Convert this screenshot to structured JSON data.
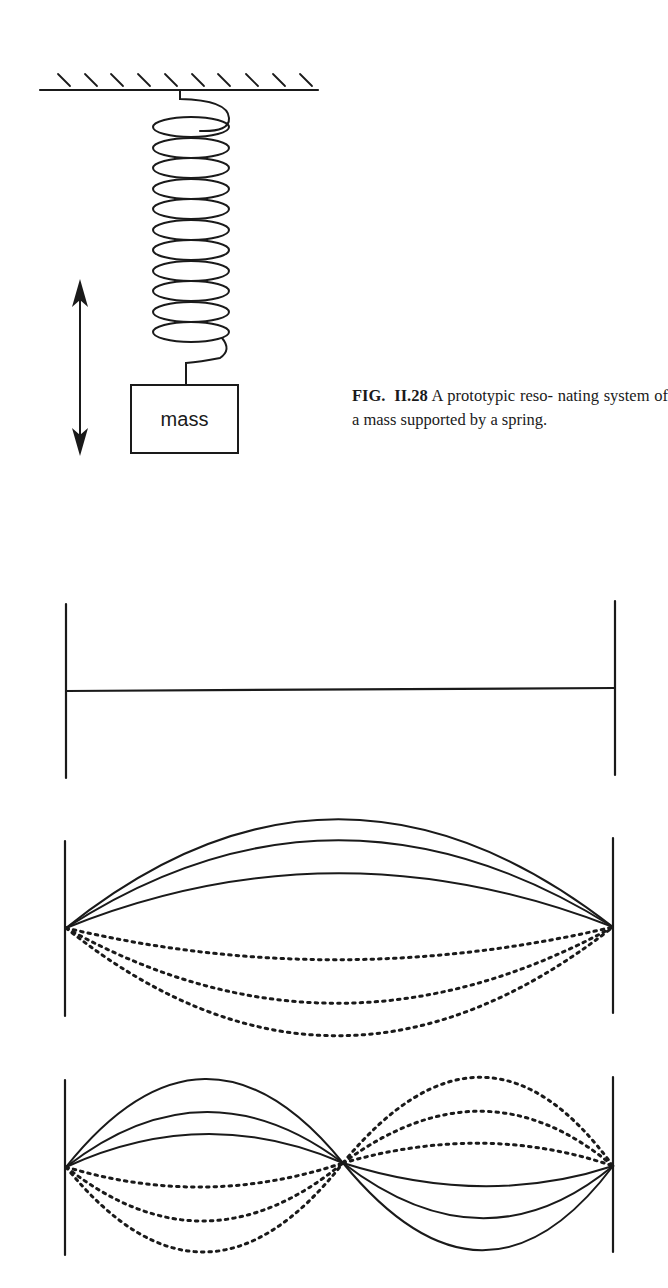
{
  "figure": {
    "label": "FIG. II.28",
    "caption_text": " A prototypic reso- nating system of a mass supported by a spring.",
    "mass_label": "mass"
  },
  "panels": [
    {
      "name": "string-at-rest",
      "description": "String fixed at both ends, at rest"
    },
    {
      "name": "fundamental-mode",
      "description": "First harmonic: one antinode, solid (up) and dotted (down) displacements"
    },
    {
      "name": "second-harmonic",
      "description": "Second harmonic: node at center, two antinodes in opposite phase"
    }
  ],
  "colors": {
    "ink": "#1a1a1a",
    "background": "#ffffff"
  }
}
